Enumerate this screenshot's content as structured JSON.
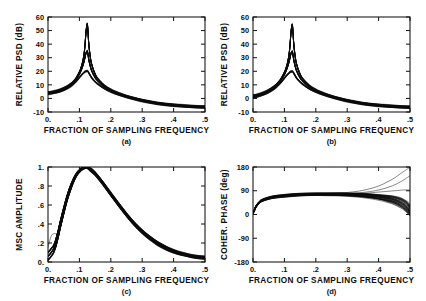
{
  "figure": {
    "background": "#ffffff",
    "ink": "#0d0d0d",
    "panel_count": 4
  },
  "common": {
    "xlabel": "FRACTION OF SAMPLING FREQUENCY",
    "xticklabels": [
      "0.",
      ".1",
      ".2",
      ".3",
      ".4",
      ".5"
    ],
    "xtickvalues": [
      0,
      0.1,
      0.2,
      0.3,
      0.4,
      0.5
    ],
    "xlim": [
      0,
      0.5
    ]
  },
  "panels": [
    {
      "id": "a",
      "caption": "(a)",
      "ylabel": "RELATIVE  PSD   (dB)",
      "yticklabels": [
        "-10",
        "0",
        "10",
        "20",
        "30",
        "40",
        "50",
        "60"
      ],
      "ytickvalues": [
        -10,
        0,
        10,
        20,
        30,
        40,
        50,
        60
      ],
      "ylim": [
        -10,
        60
      ]
    },
    {
      "id": "b",
      "caption": "(b)",
      "ylabel": "RELATIVE  PSD   (dB)",
      "yticklabels": [
        "-10",
        "0",
        "10",
        "20",
        "30",
        "40",
        "50",
        "60"
      ],
      "ytickvalues": [
        -10,
        0,
        10,
        20,
        30,
        40,
        50,
        60
      ],
      "ylim": [
        -10,
        60
      ]
    },
    {
      "id": "c",
      "caption": "(c)",
      "ylabel": "MSC  AMPLITUDE",
      "yticklabels": [
        "0.",
        ".2",
        ".4",
        ".6",
        ".8",
        "1."
      ],
      "ytickvalues": [
        0,
        0.2,
        0.4,
        0.6,
        0.8,
        1.0
      ],
      "ylim": [
        0,
        1.0
      ]
    },
    {
      "id": "d",
      "caption": "(d)",
      "ylabel": "COHER.  PHASE   (deg)",
      "yticklabels": [
        "-180",
        "-90",
        "0",
        "90",
        "180"
      ],
      "ytickvalues": [
        -180,
        -90,
        0,
        90,
        180
      ],
      "ylim": [
        -180,
        180
      ]
    }
  ],
  "chart_data": [
    {
      "type": "line",
      "panel": "a",
      "title": "",
      "xlabel": "FRACTION OF SAMPLING FREQUENCY",
      "ylabel": "RELATIVE  PSD   (dB)",
      "xlim": [
        0,
        0.5
      ],
      "ylim": [
        -10,
        60
      ],
      "grid": false,
      "legend": "none",
      "description": "Bundle of overlapping relative power spectral density estimates with a sharp resonance peak near 0.125 of the sampling frequency reaching about 55 dB; baseline starts near 4 dB at zero frequency and decays to about -6 dB at 0.5.",
      "x": [
        0.0,
        0.01,
        0.02,
        0.03,
        0.04,
        0.05,
        0.06,
        0.07,
        0.08,
        0.09,
        0.1,
        0.105,
        0.11,
        0.115,
        0.118,
        0.12,
        0.122,
        0.124,
        0.125,
        0.126,
        0.128,
        0.13,
        0.135,
        0.14,
        0.15,
        0.16,
        0.18,
        0.2,
        0.22,
        0.25,
        0.28,
        0.3,
        0.33,
        0.36,
        0.4,
        0.44,
        0.47,
        0.5
      ],
      "series": [
        {
          "name": "upper envelope",
          "values": [
            4.5,
            4.8,
            5.2,
            5.8,
            6.6,
            7.6,
            8.8,
            10.4,
            12.4,
            15.2,
            19.5,
            22.5,
            26.5,
            33.0,
            40.0,
            46.0,
            51.0,
            54.0,
            55.0,
            53.5,
            47.0,
            40.0,
            30.0,
            24.5,
            18.0,
            14.2,
            9.5,
            6.5,
            4.3,
            1.8,
            0.0,
            -1.1,
            -2.5,
            -3.6,
            -4.6,
            -5.4,
            -5.8,
            -6.0
          ]
        },
        {
          "name": "median",
          "values": [
            4.0,
            4.3,
            4.7,
            5.3,
            6.0,
            7.0,
            8.2,
            9.7,
            11.6,
            14.2,
            18.0,
            20.5,
            23.5,
            27.5,
            30.5,
            32.5,
            34.0,
            34.8,
            35.0,
            34.3,
            31.5,
            28.5,
            23.5,
            20.0,
            15.5,
            12.6,
            8.6,
            5.9,
            3.9,
            1.5,
            -0.3,
            -1.4,
            -2.8,
            -3.9,
            -4.9,
            -5.7,
            -6.1,
            -6.3
          ]
        },
        {
          "name": "lower envelope",
          "values": [
            3.4,
            3.7,
            4.1,
            4.6,
            5.3,
            6.2,
            7.3,
            8.7,
            10.4,
            12.6,
            15.4,
            16.8,
            18.0,
            19.2,
            19.7,
            20.0,
            20.1,
            20.2,
            20.2,
            20.1,
            19.6,
            18.8,
            16.8,
            15.0,
            12.4,
            10.4,
            7.3,
            5.0,
            3.2,
            1.0,
            -0.8,
            -1.9,
            -3.3,
            -4.4,
            -5.4,
            -6.1,
            -6.5,
            -6.7
          ]
        }
      ]
    },
    {
      "type": "line",
      "panel": "b",
      "title": "",
      "xlabel": "FRACTION OF SAMPLING FREQUENCY",
      "ylabel": "RELATIVE  PSD   (dB)",
      "xlim": [
        0,
        0.5
      ],
      "ylim": [
        -10,
        60
      ],
      "grid": false,
      "legend": "none",
      "description": "Same resonance structure as panel (a) but the low-frequency baseline starts lower, near 1.5 dB at zero frequency; peak near 0.125 reaches about 54 dB.",
      "x": [
        0.0,
        0.01,
        0.02,
        0.03,
        0.04,
        0.05,
        0.06,
        0.07,
        0.08,
        0.09,
        0.1,
        0.105,
        0.11,
        0.115,
        0.118,
        0.12,
        0.122,
        0.124,
        0.125,
        0.126,
        0.128,
        0.13,
        0.135,
        0.14,
        0.15,
        0.16,
        0.18,
        0.2,
        0.22,
        0.25,
        0.28,
        0.3,
        0.33,
        0.36,
        0.4,
        0.44,
        0.47,
        0.5
      ],
      "series": [
        {
          "name": "upper envelope",
          "values": [
            2.2,
            2.6,
            3.2,
            4.0,
            5.0,
            6.2,
            7.7,
            9.5,
            11.8,
            14.8,
            19.2,
            22.2,
            26.2,
            32.8,
            39.8,
            45.8,
            50.8,
            53.6,
            54.5,
            53.0,
            46.8,
            39.8,
            29.8,
            24.3,
            17.9,
            14.1,
            9.4,
            6.4,
            4.2,
            1.7,
            -0.1,
            -1.2,
            -2.6,
            -3.7,
            -4.7,
            -5.5,
            -5.9,
            -6.1
          ]
        },
        {
          "name": "median",
          "values": [
            1.5,
            1.9,
            2.5,
            3.3,
            4.3,
            5.5,
            7.0,
            8.8,
            11.0,
            13.8,
            17.6,
            20.2,
            23.2,
            27.2,
            30.2,
            32.2,
            33.8,
            34.5,
            34.7,
            34.0,
            31.2,
            28.2,
            23.2,
            19.8,
            15.3,
            12.4,
            8.5,
            5.8,
            3.8,
            1.4,
            -0.4,
            -1.5,
            -2.9,
            -4.0,
            -5.0,
            -5.8,
            -6.2,
            -6.4
          ]
        },
        {
          "name": "lower envelope",
          "values": [
            0.8,
            1.2,
            1.8,
            2.6,
            3.5,
            4.6,
            6.0,
            7.6,
            9.6,
            12.0,
            14.9,
            16.4,
            17.6,
            18.8,
            19.4,
            19.7,
            19.8,
            19.9,
            19.9,
            19.8,
            19.3,
            18.5,
            16.5,
            14.7,
            12.2,
            10.2,
            7.1,
            4.9,
            3.1,
            0.9,
            -0.9,
            -2.0,
            -3.4,
            -4.5,
            -5.5,
            -6.2,
            -6.6,
            -6.8
          ]
        }
      ]
    },
    {
      "type": "line",
      "panel": "c",
      "title": "",
      "xlabel": "FRACTION OF SAMPLING FREQUENCY",
      "ylabel": "MSC  AMPLITUDE",
      "xlim": [
        0,
        0.5
      ],
      "ylim": [
        0,
        1.0
      ],
      "grid": false,
      "legend": "none",
      "description": "Magnitude squared coherence amplitude rising from near zero at DC to a broad maximum of about 1.0 near 0.125 then decaying smoothly to about 0.04 at 0.5. One thin outlier curve departs at very low frequency reaching about 0.30 near 0.02.",
      "x": [
        0.0,
        0.01,
        0.02,
        0.03,
        0.04,
        0.05,
        0.06,
        0.07,
        0.08,
        0.09,
        0.1,
        0.11,
        0.12,
        0.125,
        0.13,
        0.14,
        0.15,
        0.17,
        0.19,
        0.21,
        0.24,
        0.27,
        0.3,
        0.33,
        0.36,
        0.4,
        0.44,
        0.47,
        0.5
      ],
      "series": [
        {
          "name": "upper envelope",
          "values": [
            0.1,
            0.14,
            0.19,
            0.3,
            0.44,
            0.57,
            0.69,
            0.79,
            0.87,
            0.93,
            0.97,
            0.995,
            1.0,
            1.0,
            0.995,
            0.975,
            0.945,
            0.865,
            0.775,
            0.685,
            0.555,
            0.435,
            0.335,
            0.255,
            0.19,
            0.125,
            0.085,
            0.065,
            0.055
          ]
        },
        {
          "name": "median",
          "values": [
            0.06,
            0.1,
            0.155,
            0.265,
            0.405,
            0.54,
            0.665,
            0.765,
            0.85,
            0.915,
            0.955,
            0.985,
            0.995,
            0.995,
            0.985,
            0.96,
            0.93,
            0.85,
            0.76,
            0.67,
            0.54,
            0.42,
            0.32,
            0.24,
            0.175,
            0.115,
            0.075,
            0.055,
            0.045
          ]
        },
        {
          "name": "lower envelope",
          "values": [
            0.02,
            0.06,
            0.115,
            0.225,
            0.37,
            0.505,
            0.635,
            0.74,
            0.83,
            0.9,
            0.945,
            0.975,
            0.99,
            0.99,
            0.975,
            0.945,
            0.915,
            0.835,
            0.745,
            0.655,
            0.525,
            0.405,
            0.305,
            0.225,
            0.16,
            0.1,
            0.065,
            0.045,
            0.035
          ]
        },
        {
          "name": "low-frequency outlier",
          "values": [
            0.155,
            0.27,
            0.3,
            0.305,
            0.425,
            0.545,
            0.67,
            0.77,
            0.855,
            0.915,
            0.955,
            0.985,
            0.995,
            0.995,
            0.985,
            0.96,
            0.93,
            0.85,
            0.76,
            0.67,
            0.54,
            0.42,
            0.32,
            0.24,
            0.175,
            0.115,
            0.075,
            0.055,
            0.045
          ]
        }
      ]
    },
    {
      "type": "line",
      "panel": "d",
      "title": "",
      "xlabel": "FRACTION OF SAMPLING FREQUENCY",
      "ylabel": "COHER.  PHASE   (deg)",
      "xlim": [
        0,
        0.5
      ],
      "ylim": [
        -180,
        180
      ],
      "grid": false,
      "legend": "none",
      "description": "Coherence phase rising steeply from about 5 degrees at DC to a plateau near 70-80 degrees across mid frequencies. Near 0.5 the bundle fans out: a few curves climb toward 180 degrees, several level near 90 degrees, and the majority fall back toward 0 degrees.",
      "x": [
        0.0,
        0.005,
        0.01,
        0.02,
        0.03,
        0.05,
        0.07,
        0.1,
        0.13,
        0.16,
        0.2,
        0.24,
        0.28,
        0.32,
        0.36,
        0.4,
        0.43,
        0.45,
        0.47,
        0.48,
        0.49,
        0.495,
        0.5
      ],
      "series": [
        {
          "name": "rising branch to 180",
          "values": [
            6,
            20,
            33,
            48,
            56,
            64,
            69,
            73,
            76,
            78,
            79,
            80,
            82,
            86,
            94,
            108,
            125,
            138,
            155,
            163,
            171,
            175,
            178
          ]
        },
        {
          "name": "branch to 130",
          "values": [
            5,
            18,
            31,
            46,
            54,
            62,
            67,
            71,
            74,
            76,
            77,
            78,
            79,
            81,
            85,
            93,
            103,
            112,
            124,
            131,
            139,
            143,
            147
          ]
        },
        {
          "name": "plateau branch near 90",
          "values": [
            5,
            17,
            30,
            45,
            53,
            61,
            66,
            70,
            73,
            75,
            76,
            77,
            78,
            79,
            81,
            85,
            88,
            90,
            92,
            93,
            93,
            93,
            93
          ]
        },
        {
          "name": "upper bundle edge",
          "values": [
            7,
            21,
            34,
            49,
            57,
            65,
            70,
            74,
            77,
            79,
            80,
            80,
            80,
            79,
            77,
            73,
            69,
            65,
            58,
            52,
            44,
            37,
            28
          ]
        },
        {
          "name": "bundle median",
          "values": [
            5,
            18,
            31,
            46,
            54,
            62,
            67,
            71,
            74,
            76,
            77,
            77,
            76,
            75,
            72,
            67,
            61,
            55,
            45,
            38,
            28,
            20,
            10
          ]
        },
        {
          "name": "lower bundle edge",
          "values": [
            3,
            15,
            28,
            43,
            51,
            59,
            64,
            68,
            71,
            73,
            74,
            74,
            73,
            71,
            67,
            60,
            52,
            45,
            33,
            25,
            15,
            8,
            2
          ]
        },
        {
          "name": "lowest branch",
          "values": [
            2,
            13,
            26,
            41,
            49,
            57,
            62,
            66,
            69,
            71,
            72,
            71,
            70,
            67,
            62,
            54,
            45,
            37,
            25,
            17,
            8,
            3,
            0
          ]
        }
      ]
    }
  ]
}
